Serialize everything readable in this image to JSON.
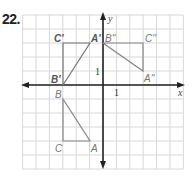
{
  "problem": {
    "number": "22."
  },
  "grid": {
    "origin_px": [
      103,
      85
    ],
    "unit_px": [
      13.4,
      14
    ],
    "x_range": [
      -6,
      6
    ],
    "y_range": [
      -6,
      5
    ],
    "color": "#d8d8d8"
  },
  "axes": {
    "x_label": "x",
    "y_label": "y",
    "x_tick_label": "1",
    "y_tick_label": "1",
    "color": "#222222"
  },
  "figures": [
    {
      "name": "triangle-ABC",
      "vertices": [
        {
          "label": "A",
          "point": [
            -1,
            -4
          ]
        },
        {
          "label": "B",
          "point": [
            -3,
            -1
          ]
        },
        {
          "label": "C",
          "point": [
            -3,
            -4
          ]
        }
      ],
      "stroke": "#888888"
    },
    {
      "name": "triangle-A'B'C'",
      "vertices": [
        {
          "label": "A'",
          "point": [
            -1,
            3
          ]
        },
        {
          "label": "B'",
          "point": [
            -3,
            0
          ]
        },
        {
          "label": "C'",
          "point": [
            -3,
            3
          ]
        }
      ],
      "stroke": "#777777"
    },
    {
      "name": "triangle-A''B''C''",
      "vertices": [
        {
          "label": "A''",
          "point": [
            3,
            1
          ]
        },
        {
          "label": "B''",
          "point": [
            0,
            3
          ]
        },
        {
          "label": "C''",
          "point": [
            3,
            3
          ]
        }
      ],
      "stroke": "#888888"
    }
  ],
  "labels": {
    "A": "A",
    "B": "B",
    "C": "C",
    "A1": "A'",
    "B1": "B'",
    "C1": "C'",
    "A2": "A''",
    "B2": "B''",
    "C2": "C''"
  }
}
